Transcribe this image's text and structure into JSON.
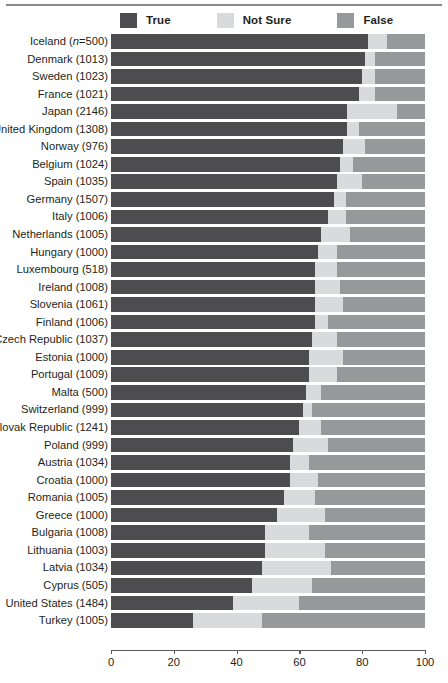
{
  "chart_data": {
    "type": "bar",
    "subtype": "stacked-horizontal-100-percent",
    "title": "",
    "subtitle": "",
    "xlabel": "",
    "ylabel": "",
    "xlim": [
      0,
      100
    ],
    "xticks": [
      0,
      20,
      40,
      60,
      80,
      100
    ],
    "xtick_labels": [
      "0",
      "20",
      "40",
      "60",
      "80",
      "100"
    ],
    "grid": false,
    "legend_position": "top",
    "colors": {
      "True": "#4d4d4f",
      "Not Sure": "#d9dadb",
      "False": "#969899",
      "axis": "#58595b",
      "text": "#231f20",
      "background": "#ffffff",
      "top_rule": "#8a8a8a"
    },
    "legend": [
      {
        "label": "True",
        "color": "#4d4d4f",
        "key": "true"
      },
      {
        "label": "Not Sure",
        "color": "#d9dadb",
        "key": "not_sure"
      },
      {
        "label": "False",
        "color": "#969899",
        "key": "false"
      }
    ],
    "series": [
      {
        "name": "True",
        "color": "#4d4d4f"
      },
      {
        "name": "Not Sure",
        "color": "#d9dadb"
      },
      {
        "name": "False",
        "color": "#969899"
      }
    ],
    "categories": [
      "Iceland (n=500)",
      "Denmark (1013)",
      "Sweden (1023)",
      "France (1021)",
      "Japan (2146)",
      "United Kingdom (1308)",
      "Norway (976)",
      "Belgium (1024)",
      "Spain (1035)",
      "Germany (1507)",
      "Italy (1006)",
      "Netherlands (1005)",
      "Hungary (1000)",
      "Luxembourg (518)",
      "Ireland (1008)",
      "Slovenia (1061)",
      "Finland (1006)",
      "Czech Republic (1037)",
      "Estonia (1000)",
      "Portugal (1009)",
      "Malta (500)",
      "Switzerland (999)",
      "Slovak Republic (1241)",
      "Poland (999)",
      "Austria (1034)",
      "Croatia (1000)",
      "Romania (1005)",
      "Greece (1000)",
      "Bulgaria (1008)",
      "Lithuania (1003)",
      "Latvia (1034)",
      "Cyprus (505)",
      "United States (1484)",
      "Turkey (1005)"
    ],
    "rows": [
      {
        "label_text": "Iceland (",
        "label_italic": "n",
        "label_tail": "=500)",
        "label": "Iceland (n=500)",
        "true": 82,
        "not_sure": 6,
        "false": 12
      },
      {
        "label": "Denmark (1013)",
        "true": 81,
        "not_sure": 3,
        "false": 16
      },
      {
        "label": "Sweden (1023)",
        "true": 80,
        "not_sure": 4,
        "false": 16
      },
      {
        "label": "France (1021)",
        "true": 79,
        "not_sure": 5,
        "false": 16
      },
      {
        "label": "Japan (2146)",
        "true": 75,
        "not_sure": 16,
        "false": 9
      },
      {
        "label": "United Kingdom (1308)",
        "true": 75,
        "not_sure": 4,
        "false": 21
      },
      {
        "label": "Norway (976)",
        "true": 74,
        "not_sure": 7,
        "false": 19
      },
      {
        "label": "Belgium (1024)",
        "true": 73,
        "not_sure": 4,
        "false": 23
      },
      {
        "label": "Spain (1035)",
        "true": 72,
        "not_sure": 8,
        "false": 20
      },
      {
        "label": "Germany (1507)",
        "true": 71,
        "not_sure": 4,
        "false": 25
      },
      {
        "label": "Italy (1006)",
        "true": 69,
        "not_sure": 6,
        "false": 25
      },
      {
        "label": "Netherlands (1005)",
        "true": 67,
        "not_sure": 9,
        "false": 24
      },
      {
        "label": "Hungary (1000)",
        "true": 66,
        "not_sure": 6,
        "false": 28
      },
      {
        "label": "Luxembourg (518)",
        "true": 65,
        "not_sure": 7,
        "false": 28
      },
      {
        "label": "Ireland (1008)",
        "true": 65,
        "not_sure": 8,
        "false": 27
      },
      {
        "label": "Slovenia (1061)",
        "true": 65,
        "not_sure": 9,
        "false": 26
      },
      {
        "label": "Finland (1006)",
        "true": 65,
        "not_sure": 4,
        "false": 31
      },
      {
        "label": "Czech Republic (1037)",
        "true": 64,
        "not_sure": 8,
        "false": 28
      },
      {
        "label": "Estonia (1000)",
        "true": 63,
        "not_sure": 11,
        "false": 26
      },
      {
        "label": "Portugal (1009)",
        "true": 63,
        "not_sure": 9,
        "false": 28
      },
      {
        "label": "Malta (500)",
        "true": 62,
        "not_sure": 5,
        "false": 33
      },
      {
        "label": "Switzerland (999)",
        "true": 61,
        "not_sure": 3,
        "false": 36
      },
      {
        "label": "Slovak Republic (1241)",
        "true": 60,
        "not_sure": 7,
        "false": 33
      },
      {
        "label": "Poland (999)",
        "true": 58,
        "not_sure": 11,
        "false": 31
      },
      {
        "label": "Austria (1034)",
        "true": 57,
        "not_sure": 6,
        "false": 37
      },
      {
        "label": "Croatia (1000)",
        "true": 57,
        "not_sure": 9,
        "false": 34
      },
      {
        "label": "Romania (1005)",
        "true": 55,
        "not_sure": 10,
        "false": 35
      },
      {
        "label": "Greece (1000)",
        "true": 53,
        "not_sure": 15,
        "false": 32
      },
      {
        "label": "Bulgaria (1008)",
        "true": 49,
        "not_sure": 14,
        "false": 37
      },
      {
        "label": "Lithuania (1003)",
        "true": 49,
        "not_sure": 19,
        "false": 32
      },
      {
        "label": "Latvia (1034)",
        "true": 48,
        "not_sure": 22,
        "false": 30
      },
      {
        "label": "Cyprus (505)",
        "true": 45,
        "not_sure": 19,
        "false": 36
      },
      {
        "label": "United States (1484)",
        "true": 39,
        "not_sure": 21,
        "false": 40
      },
      {
        "label": "Turkey (1005)",
        "true": 26,
        "not_sure": 22,
        "false": 52
      }
    ]
  }
}
